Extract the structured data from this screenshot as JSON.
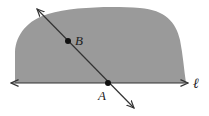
{
  "diagram": {
    "title": "",
    "region": {
      "name": "half-plane",
      "fill": "#9a9a9a"
    },
    "line_l": {
      "label": "ℓ",
      "y": 83,
      "x1": 11,
      "x2": 188
    },
    "transversal": {
      "x1": 37,
      "y1": 9,
      "x2": 134,
      "y2": 108
    },
    "points": [
      {
        "name": "B",
        "label": "B",
        "x": 68,
        "y": 41,
        "label_x": 75,
        "label_y": 45
      },
      {
        "name": "A",
        "label": "A",
        "x": 108,
        "y": 83,
        "label_x": 98,
        "label_y": 100
      }
    ],
    "colors": {
      "stroke": "#333333",
      "point": "#111111",
      "shade": "#9a9a9a"
    }
  }
}
